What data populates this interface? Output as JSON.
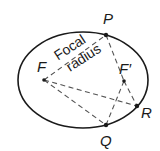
{
  "diagram": {
    "ellipse": {
      "cx": 83,
      "cy": 80,
      "rx": 65,
      "ry": 48
    },
    "points": {
      "P": {
        "label": "P",
        "x": 106,
        "y": 35
      },
      "F": {
        "label": "F",
        "x": 44,
        "y": 80
      },
      "F2": {
        "label": "F′",
        "x": 124,
        "y": 81
      },
      "R": {
        "label": "R",
        "x": 137,
        "y": 106
      },
      "Q": {
        "label": "Q",
        "x": 106,
        "y": 125
      }
    },
    "annotation": {
      "line1": "Focal",
      "line2": "radius"
    },
    "dashed_lines": [
      [
        "F",
        "P"
      ],
      [
        "P",
        "F2"
      ],
      [
        "F2",
        "R"
      ],
      [
        "F",
        "R"
      ],
      [
        "F",
        "Q"
      ],
      [
        "Q",
        "F2"
      ]
    ],
    "colors": {
      "stroke": "#1a1a1a",
      "dashed": "#555555",
      "background": "#ffffff"
    }
  }
}
